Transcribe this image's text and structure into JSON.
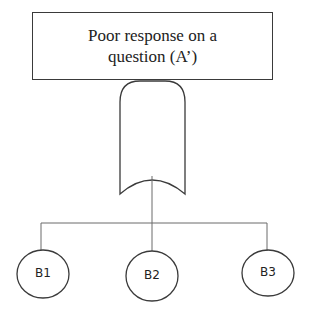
{
  "diagram": {
    "type": "fault-tree",
    "top_event": {
      "line1": "Poor response on a",
      "line2": "question (A’)"
    },
    "gate": {
      "type": "or-gate"
    },
    "children": [
      {
        "id": "B1",
        "label": "B1"
      },
      {
        "id": "B2",
        "label": "B2"
      },
      {
        "id": "B3",
        "label": "B3"
      }
    ]
  },
  "colors": {
    "line": "#3a3a3a",
    "background": "#ffffff"
  }
}
